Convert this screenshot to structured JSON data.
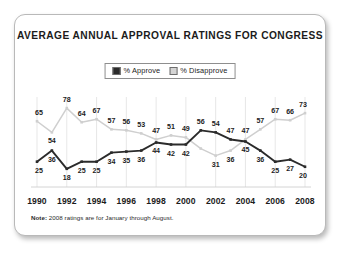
{
  "card": {
    "title": "AVERAGE ANNUAL APPROVAL RATINGS FOR CONGRESS",
    "note_prefix": "Note:",
    "note_text": " 2008 ratings are for January through August."
  },
  "legend": {
    "approve_label": "% Approve",
    "disapprove_label": "% Disapprove",
    "approve_color": "#2b2b2b",
    "disapprove_color": "#d4d4d4"
  },
  "chart_data": {
    "type": "line",
    "title": "AVERAGE ANNUAL APPROVAL RATINGS FOR CONGRESS",
    "xlabel": "",
    "ylabel": "",
    "ylim": [
      0,
      85
    ],
    "grid": true,
    "legend_position": "top-center",
    "annotation": "Note: 2008 ratings are for January through August.",
    "x": [
      1990,
      1991,
      1992,
      1993,
      1994,
      1995,
      1996,
      1997,
      1998,
      1999,
      2000,
      2001,
      2002,
      2003,
      2004,
      2005,
      2006,
      2007,
      2008
    ],
    "tick_labels": [
      "1990",
      "1992",
      "1994",
      "1996",
      "1998",
      "2000",
      "2002",
      "2004",
      "2006",
      "2008"
    ],
    "tick_years": [
      1990,
      1992,
      1994,
      1996,
      1998,
      2000,
      2002,
      2004,
      2006,
      2008
    ],
    "series": [
      {
        "name": "% Approve",
        "color": "#2b2b2b",
        "values": [
          25,
          36,
          18,
          25,
          25,
          34,
          35,
          36,
          44,
          42,
          42,
          56,
          54,
          47,
          45,
          36,
          25,
          27,
          20
        ],
        "labels": [
          "25",
          "36",
          "18",
          "25",
          "25",
          "34",
          "35",
          "36",
          "44",
          "42",
          "42",
          "56",
          "54",
          "47",
          "45",
          "36",
          "25",
          "27",
          "20"
        ],
        "label_side": [
          "below",
          "below",
          "below",
          "below",
          "below",
          "below",
          "below",
          "below",
          "below",
          "below",
          "below",
          "above",
          "above",
          "above",
          "below",
          "below",
          "below",
          "below",
          "below"
        ]
      },
      {
        "name": "% Disapprove",
        "color": "#cfcfcf",
        "values": [
          65,
          54,
          78,
          64,
          67,
          57,
          56,
          53,
          47,
          51,
          49,
          38,
          31,
          36,
          47,
          57,
          67,
          66,
          73
        ],
        "labels": [
          "65",
          "54",
          "78",
          "64",
          "67",
          "57",
          "56",
          "53",
          "47",
          "51",
          "49",
          "",
          "31",
          "36",
          "47",
          "57",
          "67",
          "66",
          "73"
        ],
        "label_side": [
          "above",
          "below",
          "above",
          "above",
          "above",
          "above",
          "above",
          "above",
          "above",
          "above",
          "above",
          "",
          "below",
          "below",
          "above",
          "above",
          "above",
          "above",
          "above"
        ]
      }
    ]
  }
}
